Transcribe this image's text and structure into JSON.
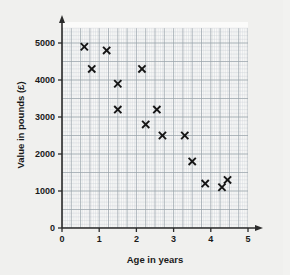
{
  "page": {
    "background_color": "#f0f0ee",
    "plot_background_color": "#fbfbfa"
  },
  "chart_data": {
    "type": "scatter",
    "title": "",
    "xlabel": "Age in years",
    "ylabel": "Value in pounds (£)",
    "xlim": [
      0,
      5.4
    ],
    "ylim": [
      0,
      5400
    ],
    "xticks": [
      0,
      1,
      2,
      3,
      4,
      5
    ],
    "xtick_labels": [
      "0",
      "1",
      "2",
      "3",
      "4",
      "5"
    ],
    "yticks": [
      0,
      1000,
      2000,
      3000,
      4000,
      5000
    ],
    "ytick_labels": [
      "0",
      "1000",
      "2000",
      "3000",
      "4000",
      "5000"
    ],
    "grid": true,
    "grid_minor_step_x": 0.05,
    "grid_minor_step_y": 100,
    "grid_major_step_x": 0.25,
    "grid_major_step_y": 500,
    "legend": null,
    "marker": "x",
    "marker_color": "#151515",
    "points": [
      {
        "x": 0.6,
        "y": 4900
      },
      {
        "x": 0.8,
        "y": 4300
      },
      {
        "x": 1.2,
        "y": 4800
      },
      {
        "x": 1.5,
        "y": 3900
      },
      {
        "x": 1.5,
        "y": 3200
      },
      {
        "x": 2.15,
        "y": 4300
      },
      {
        "x": 2.25,
        "y": 2800
      },
      {
        "x": 2.55,
        "y": 3200
      },
      {
        "x": 2.7,
        "y": 2500
      },
      {
        "x": 3.3,
        "y": 2500
      },
      {
        "x": 3.5,
        "y": 1800
      },
      {
        "x": 3.85,
        "y": 1200
      },
      {
        "x": 4.3,
        "y": 1100
      },
      {
        "x": 4.45,
        "y": 1300
      }
    ]
  },
  "axes": {
    "x_title": "Age in years",
    "y_title": "Value in pounds (£)"
  }
}
